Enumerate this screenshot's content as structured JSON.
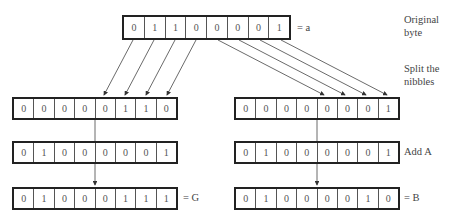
{
  "diagram": {
    "original": {
      "bits": [
        "0",
        "1",
        "1",
        "0",
        "0",
        "0",
        "0",
        "1"
      ],
      "suffix": "= a"
    },
    "left": {
      "split": [
        "0",
        "0",
        "0",
        "0",
        "0",
        "1",
        "1",
        "0"
      ],
      "addend": [
        "0",
        "1",
        "0",
        "0",
        "0",
        "0",
        "0",
        "1"
      ],
      "result": [
        "0",
        "1",
        "0",
        "0",
        "0",
        "1",
        "1",
        "1"
      ],
      "result_suffix": "= G"
    },
    "right": {
      "split": [
        "0",
        "0",
        "0",
        "0",
        "0",
        "0",
        "0",
        "1"
      ],
      "addend": [
        "0",
        "1",
        "0",
        "0",
        "0",
        "0",
        "0",
        "1"
      ],
      "result": [
        "0",
        "1",
        "0",
        "0",
        "0",
        "0",
        "1",
        "0"
      ],
      "result_suffix": "= B"
    },
    "annotations": {
      "original_byte_line1": "Original",
      "original_byte_line2": "byte",
      "split_line1": "Split the",
      "split_line2": "nibbles",
      "add": "Add A"
    }
  }
}
